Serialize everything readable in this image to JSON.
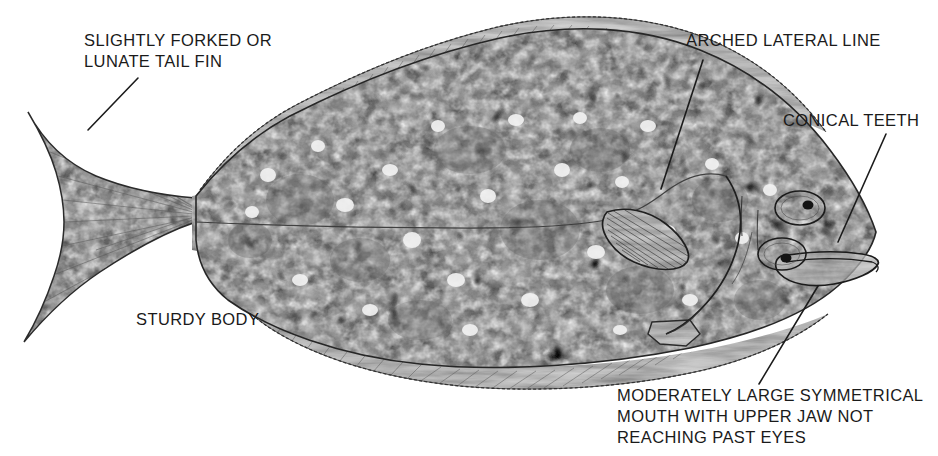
{
  "diagram": {
    "background_color": "#ffffff",
    "ink_color": "#1b1b1b",
    "body_tone_light": "#d8d8d8",
    "body_tone_mid": "#9a9a9a",
    "body_tone_dark": "#4a4a4a"
  },
  "labels": {
    "tail_fin": "SLIGHTLY FORKED OR\nLUNATE TAIL FIN",
    "lateral_line": "ARCHED LATERAL LINE",
    "conical_teeth": "CONICAL TEETH",
    "sturdy_body": "STURDY BODY",
    "mouth": "MODERATELY LARGE SYMMETRICAL\nMOUTH WITH UPPER JAW NOT\nREACHING PAST EYES"
  },
  "anatomy": {
    "parts": [
      "caudal-fin",
      "caudal-peduncle",
      "dorsal-fin",
      "anal-fin",
      "pectoral-fin",
      "pelvic-fin",
      "lateral-line",
      "upper-eye",
      "lower-eye",
      "gill-cover",
      "mouth",
      "body"
    ]
  },
  "leaders": {
    "tail_fin": "from label down-right to tail fin",
    "lateral_line": "from label down-left to lateral line arch",
    "conical_teeth": "from label down-left to jaw",
    "mouth": "from label up-right to mouth"
  }
}
